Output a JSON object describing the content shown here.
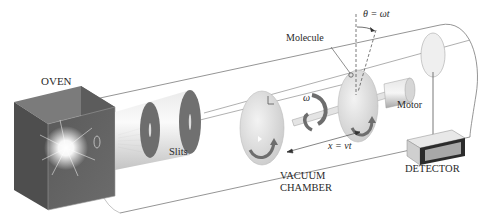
{
  "diagram": {
    "labels": {
      "oven": "OVEN",
      "slits": "Slits",
      "molecule": "Molecule",
      "theta_eq": "θ = ωt",
      "omega": "ω",
      "motor": "Motor",
      "distance_eq": "x = vt",
      "vacuum_chamber_line1": "VACUUM",
      "vacuum_chamber_line2": "CHAMBER",
      "detector": "DETECTOR"
    },
    "components": [
      {
        "id": "oven",
        "label": "OVEN"
      },
      {
        "id": "slits",
        "label": "Slits",
        "count": 2
      },
      {
        "id": "vacuum-chamber",
        "label": "VACUUM CHAMBER"
      },
      {
        "id": "rotating-disks",
        "count": 2
      },
      {
        "id": "motor",
        "label": "Motor"
      },
      {
        "id": "detector",
        "label": "DETECTOR"
      }
    ],
    "colors": {
      "background": "#ffffff",
      "line": "#555555",
      "oven_dark": "#4a4a4a",
      "oven_mid": "#6e6e6e",
      "disk": "#d8d8d8",
      "arrow": "#6a6a6a",
      "text": "#2a2a2a"
    }
  }
}
